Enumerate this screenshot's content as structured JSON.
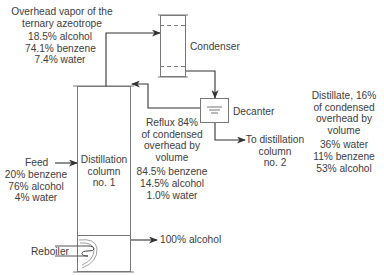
{
  "overhead_vapor": {
    "title_line1": "Overhead vapor of the",
    "title_line2": "ternary azeotrope",
    "comp1": "18.5% alcohol",
    "comp2": "74.1% benzene",
    "comp3": "7.4% water"
  },
  "condenser": {
    "label": "Condenser"
  },
  "decanter": {
    "label": "Decanter"
  },
  "reflux": {
    "line1": "Reflux 84%",
    "line2": "of condensed",
    "line3": "overhead by",
    "line4": "volume",
    "comp1": "84.5% benzene",
    "comp2": "14.5% alcohol",
    "comp3": "1.0% water"
  },
  "to_column2": {
    "line1": "To distillation",
    "line2": "column",
    "line3": "no. 2"
  },
  "distillate": {
    "line1": "Distillate, 16%",
    "line2": "of condensed",
    "line3": "overhead by",
    "line4": "volume",
    "comp1": "36% water",
    "comp2": "11% benzene",
    "comp3": "53% alcohol"
  },
  "column": {
    "line1": "Distillation",
    "line2": "column",
    "line3": "no. 1"
  },
  "feed": {
    "label": "Feed",
    "comp1": "20% benzene",
    "comp2": "76% alcohol",
    "comp3": "4% water"
  },
  "reboiler": {
    "label": "Reboiler"
  },
  "bottoms": {
    "label": "100% alcohol"
  },
  "colors": {
    "line": "#3a3a3a",
    "vessel": "#7a7a7a",
    "background": "#ffffff"
  }
}
